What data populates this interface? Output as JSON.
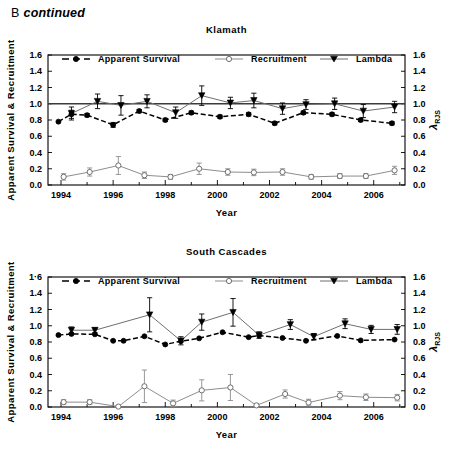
{
  "panel": {
    "letter": "B",
    "note": "continued"
  },
  "colors": {
    "survival": "#000000",
    "lambda": "#6f6f6f",
    "recruitment": "#8d8d8d",
    "reference_line": "#3b3b3b",
    "axis": "#000000"
  },
  "legend": {
    "items": [
      {
        "label": "Apparent Survival",
        "marker": "filled-circle",
        "line": "dashed"
      },
      {
        "label": "Recruitment",
        "marker": "open-circle",
        "line": "solid"
      },
      {
        "label": "Lambda",
        "marker": "filled-triangle-down",
        "line": "solid"
      }
    ]
  },
  "axis": {
    "xlabel": "Year",
    "ylabel_left": "Apparent Survival & Recruitment",
    "ylabel_right_main": "λ",
    "ylabel_right_sub": "RJS",
    "ytick_labels": [
      "0.0",
      "0.2",
      "0.4",
      "0.6",
      "0.8",
      "1.0",
      "1.2",
      "1.4",
      "1.6"
    ],
    "ytick_labels_south_left": [
      "0.0",
      "0.2",
      "0.4",
      "0.6",
      "0.8",
      "1.0",
      "1.2",
      "1.4",
      "1·6"
    ],
    "xtick_labels": [
      "1994",
      "1996",
      "1998",
      "2000",
      "2002",
      "2004",
      "2006"
    ],
    "ylim": [
      0.0,
      1.6
    ],
    "xlim": [
      1993.5,
      2007.2
    ],
    "ytick_step": 0.2,
    "xtick_major_step": 2,
    "xtick_minor_step": 1
  },
  "chart_data": [
    {
      "type": "line",
      "title": "Klamath",
      "xlabel": "Year",
      "ylabel": "Apparent Survival & Recruitment",
      "ylabel2": "λ RJS",
      "ylim": [
        0.0,
        1.6
      ],
      "xlim": [
        1993.5,
        2007.2
      ],
      "grid": false,
      "legend_position": "top",
      "reference_line_y": 1.0,
      "series": [
        {
          "name": "Apparent Survival",
          "marker": "filled-circle",
          "line": "dashed",
          "color": "#000000",
          "x": [
            1993.9,
            1994.4,
            1995.0,
            1996.0,
            1997.0,
            1998.0,
            1999.0,
            2000.1,
            2001.2,
            2002.2,
            2003.3,
            2004.4,
            2005.5,
            2006.7
          ],
          "values": [
            0.78,
            0.87,
            0.86,
            0.74,
            0.91,
            0.8,
            0.89,
            0.84,
            0.87,
            0.76,
            0.89,
            0.87,
            0.8,
            0.76
          ],
          "err_low": [
            0.0,
            0.05,
            0.02,
            0.03,
            0.02,
            0.02,
            0.02,
            0.02,
            0.02,
            0.02,
            0.02,
            0.02,
            0.02,
            0.02
          ],
          "err_high": [
            0.0,
            0.05,
            0.02,
            0.03,
            0.02,
            0.02,
            0.02,
            0.02,
            0.02,
            0.02,
            0.02,
            0.02,
            0.02,
            0.02
          ]
        },
        {
          "name": "Lambda",
          "marker": "filled-triangle-down",
          "line": "solid",
          "color": "#6f6f6f",
          "x": [
            1994.4,
            1995.4,
            1996.3,
            1997.3,
            1998.4,
            1999.4,
            2000.5,
            2001.4,
            2002.5,
            2003.4,
            2004.5,
            2005.6,
            2006.8
          ],
          "values": [
            0.88,
            1.03,
            0.98,
            1.03,
            0.89,
            1.1,
            1.01,
            1.04,
            0.94,
            0.99,
            1.0,
            0.91,
            0.96
          ],
          "err_low": [
            0.08,
            0.09,
            0.12,
            0.08,
            0.07,
            0.12,
            0.07,
            0.09,
            0.07,
            0.06,
            0.07,
            0.08,
            0.07
          ],
          "err_high": [
            0.08,
            0.09,
            0.12,
            0.08,
            0.07,
            0.12,
            0.07,
            0.09,
            0.07,
            0.06,
            0.07,
            0.08,
            0.07
          ]
        },
        {
          "name": "Recruitment",
          "marker": "open-circle",
          "line": "solid",
          "color": "#8d8d8d",
          "x": [
            1994.1,
            1995.1,
            1996.2,
            1997.2,
            1998.2,
            1999.3,
            2000.4,
            2001.4,
            2002.5,
            2003.6,
            2004.7,
            2005.7,
            2006.8
          ],
          "values": [
            0.1,
            0.16,
            0.24,
            0.12,
            0.1,
            0.2,
            0.16,
            0.155,
            0.16,
            0.1,
            0.11,
            0.11,
            0.18
          ],
          "err_low": [
            0.04,
            0.05,
            0.11,
            0.04,
            0.03,
            0.07,
            0.04,
            0.04,
            0.04,
            0.03,
            0.03,
            0.03,
            0.05
          ],
          "err_high": [
            0.04,
            0.05,
            0.11,
            0.04,
            0.03,
            0.07,
            0.04,
            0.04,
            0.04,
            0.03,
            0.03,
            0.03,
            0.05
          ]
        }
      ]
    },
    {
      "type": "line",
      "title": "South Cascades",
      "xlabel": "Year",
      "ylabel": "Apparent Survival & Recruitment",
      "ylabel2": "λ RJS",
      "ylim": [
        0.0,
        1.6
      ],
      "xlim": [
        1993.5,
        2007.2
      ],
      "grid": false,
      "legend_position": "top",
      "reference_line_y": null,
      "series": [
        {
          "name": "Apparent Survival",
          "marker": "filled-circle",
          "line": "dashed",
          "color": "#000000",
          "x": [
            1993.9,
            1994.4,
            1995.3,
            1996.0,
            1996.4,
            1997.2,
            1998.0,
            1998.6,
            1999.3,
            2000.2,
            2001.2,
            2001.6,
            2002.5,
            2003.4,
            2004.6,
            2005.5,
            2006.8
          ],
          "values": [
            0.885,
            0.9,
            0.895,
            0.815,
            0.815,
            0.87,
            0.77,
            0.81,
            0.845,
            0.92,
            0.86,
            0.88,
            0.85,
            0.815,
            0.875,
            0.82,
            0.83
          ],
          "err_low": [
            0.0,
            0.0,
            0.0,
            0.0,
            0.0,
            0.0,
            0.0,
            0.0,
            0.0,
            0.0,
            0.0,
            0.0,
            0.0,
            0.0,
            0.0,
            0.0,
            0.0
          ],
          "err_high": [
            0.0,
            0.0,
            0.0,
            0.0,
            0.0,
            0.0,
            0.0,
            0.0,
            0.0,
            0.0,
            0.0,
            0.0,
            0.0,
            0.0,
            0.0,
            0.0,
            0.0
          ]
        },
        {
          "name": "Lambda",
          "marker": "filled-triangle-down",
          "line": "solid",
          "color": "#6f6f6f",
          "x": [
            1994.4,
            1995.3,
            1997.4,
            1998.6,
            1999.4,
            2000.6,
            2001.6,
            2002.8,
            2003.7,
            2004.9,
            2005.9,
            2006.9
          ],
          "values": [
            0.945,
            0.945,
            1.135,
            0.815,
            1.045,
            1.165,
            0.885,
            1.015,
            0.865,
            1.025,
            0.955,
            0.955
          ],
          "err_low": [
            0.04,
            0.03,
            0.21,
            0.05,
            0.1,
            0.17,
            0.04,
            0.06,
            0.04,
            0.06,
            0.05,
            0.06
          ],
          "err_high": [
            0.04,
            0.03,
            0.21,
            0.05,
            0.1,
            0.17,
            0.04,
            0.06,
            0.04,
            0.06,
            0.05,
            0.06
          ]
        },
        {
          "name": "Recruitment",
          "marker": "open-circle",
          "line": "solid",
          "color": "#8d8d8d",
          "x": [
            1994.1,
            1995.1,
            1996.2,
            1997.2,
            1998.3,
            1999.4,
            2000.5,
            2001.5,
            2002.6,
            2003.5,
            2004.7,
            2005.7,
            2006.9
          ],
          "values": [
            0.06,
            0.06,
            0.005,
            0.255,
            0.045,
            0.205,
            0.24,
            0.02,
            0.16,
            0.055,
            0.14,
            0.12,
            0.115
          ],
          "err_low": [
            0.03,
            0.03,
            0.01,
            0.2,
            0.04,
            0.13,
            0.16,
            0.02,
            0.05,
            0.04,
            0.05,
            0.04,
            0.04
          ],
          "err_high": [
            0.03,
            0.03,
            0.01,
            0.2,
            0.04,
            0.13,
            0.16,
            0.02,
            0.05,
            0.04,
            0.05,
            0.04,
            0.04
          ]
        }
      ]
    }
  ]
}
